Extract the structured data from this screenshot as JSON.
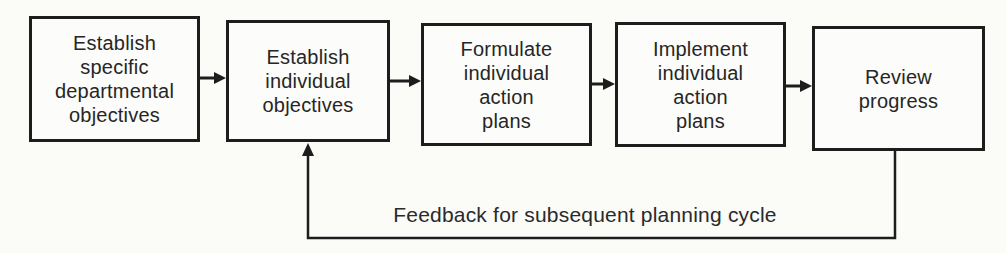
{
  "diagram": {
    "type": "flowchart",
    "boxes": [
      {
        "id": "establish-departmental-objectives",
        "label": "Establish\nspecific\ndepartmental\nobjectives"
      },
      {
        "id": "establish-individual-objectives",
        "label": "Establish\nindividual\nobjectives"
      },
      {
        "id": "formulate-action-plans",
        "label": "Formulate\nindividual\naction\nplans"
      },
      {
        "id": "implement-action-plans",
        "label": "Implement\nindividual\naction\nplans"
      },
      {
        "id": "review-progress",
        "label": "Review\nprogress"
      }
    ],
    "connections": [
      {
        "from": "establish-departmental-objectives",
        "to": "establish-individual-objectives",
        "type": "forward"
      },
      {
        "from": "establish-individual-objectives",
        "to": "formulate-action-plans",
        "type": "forward"
      },
      {
        "from": "formulate-action-plans",
        "to": "implement-action-plans",
        "type": "forward"
      },
      {
        "from": "implement-action-plans",
        "to": "review-progress",
        "type": "forward"
      },
      {
        "from": "review-progress",
        "to": "establish-individual-objectives",
        "type": "feedback",
        "label": "Feedback for subsequent planning cycle"
      }
    ],
    "feedback_label": "Feedback for subsequent planning cycle"
  },
  "colors": {
    "ink": "#1d1d1d",
    "paper": "#fbfbf8",
    "box_fill": "#fcfcfa"
  }
}
